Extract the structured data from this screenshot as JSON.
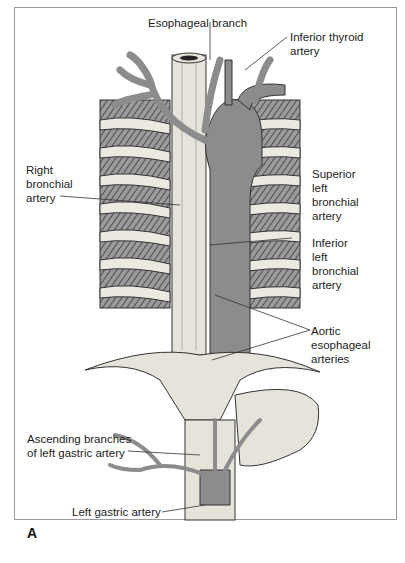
{
  "figure": {
    "panel_letter": "A",
    "labels": {
      "esophageal_branch": "Esophageal branch",
      "inferior_thyroid_artery": "Inferior thyroid\nartery",
      "right_bronchial_artery": "Right\nbronchial\nartery",
      "superior_left_bronchial_artery": "Superior\nleft\nbronchial\nartery",
      "inferior_left_bronchial_artery": "Inferior\nleft\nbronchial\nartery",
      "aortic_esophageal_arteries": "Aortic\nesophageal\narteries",
      "ascending_branches_left_gastric": "Ascending branches\nof left gastric artery",
      "left_gastric_artery": "Left gastric artery"
    },
    "colors": {
      "artery": "#8c8c8c",
      "esophagus": "#e6e3da",
      "muscle": "#6b6b6b",
      "rib": "#ece9e0",
      "outline": "#333333"
    }
  }
}
